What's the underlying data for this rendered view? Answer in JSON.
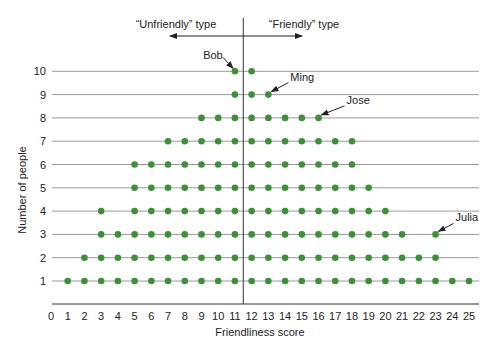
{
  "chart_data": {
    "type": "scatter",
    "subtype": "dot-plot",
    "title": "",
    "xlabel": "Friendliness score",
    "ylabel": "Number of people",
    "xlim": [
      0,
      25
    ],
    "ylim": [
      1,
      10
    ],
    "x_ticks": [
      0,
      1,
      2,
      3,
      4,
      5,
      6,
      7,
      8,
      9,
      10,
      11,
      12,
      13,
      14,
      15,
      16,
      17,
      18,
      19,
      20,
      21,
      22,
      23,
      24,
      25
    ],
    "y_ticks": [
      1,
      2,
      3,
      4,
      5,
      6,
      7,
      8,
      9,
      10
    ],
    "grid": "horizontal lines at each y tick",
    "divider_between_scores": [
      11,
      12
    ],
    "regions": [
      {
        "label": "“Unfriendly” type",
        "direction": "left"
      },
      {
        "label": "“Friendly” type",
        "direction": "right"
      }
    ],
    "rows": [
      {
        "y": 1,
        "x": [
          1,
          2,
          3,
          4,
          5,
          6,
          7,
          8,
          9,
          10,
          11,
          12,
          13,
          14,
          15,
          16,
          17,
          18,
          19,
          20,
          21,
          22,
          23,
          24,
          25
        ]
      },
      {
        "y": 2,
        "x": [
          2,
          3,
          4,
          5,
          6,
          7,
          8,
          9,
          10,
          11,
          12,
          13,
          14,
          15,
          16,
          17,
          18,
          19,
          20,
          21,
          22,
          23
        ]
      },
      {
        "y": 3,
        "x": [
          3,
          4,
          5,
          6,
          7,
          8,
          9,
          10,
          11,
          12,
          13,
          14,
          15,
          16,
          17,
          18,
          19,
          20,
          21,
          23
        ]
      },
      {
        "y": 4,
        "x": [
          3,
          5,
          6,
          7,
          8,
          9,
          10,
          11,
          12,
          13,
          14,
          15,
          16,
          17,
          18,
          19,
          20
        ]
      },
      {
        "y": 5,
        "x": [
          5,
          6,
          7,
          8,
          9,
          10,
          11,
          12,
          13,
          14,
          15,
          16,
          17,
          18,
          19
        ]
      },
      {
        "y": 6,
        "x": [
          5,
          6,
          7,
          8,
          9,
          10,
          11,
          12,
          13,
          14,
          15,
          16,
          17,
          18
        ]
      },
      {
        "y": 7,
        "x": [
          7,
          8,
          9,
          10,
          11,
          12,
          13,
          14,
          15,
          16,
          17,
          18
        ]
      },
      {
        "y": 8,
        "x": [
          9,
          10,
          11,
          12,
          13,
          14,
          15,
          16
        ]
      },
      {
        "y": 9,
        "x": [
          11,
          12,
          13
        ]
      },
      {
        "y": 10,
        "x": [
          11,
          12
        ]
      }
    ],
    "annotations": [
      {
        "text": "Bob",
        "x": 11,
        "y": 10
      },
      {
        "text": "Ming",
        "x": 13,
        "y": 9
      },
      {
        "text": "Jose",
        "x": 16,
        "y": 8
      },
      {
        "text": "Julia",
        "x": 23,
        "y": 3
      }
    ],
    "colors": {
      "dot": "#3f8f3a",
      "grid": "#9a9a9a",
      "axis": "#333333",
      "text": "#222222"
    }
  }
}
